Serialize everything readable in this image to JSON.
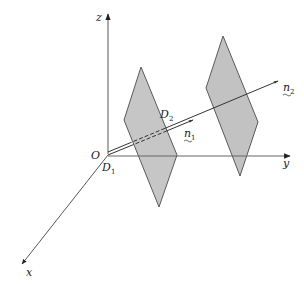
{
  "diagram": {
    "type": "3d-axes-planes",
    "colors": {
      "axis": "#555555",
      "plane_fill": "#c4c4c4",
      "plane_stroke": "#5a5a5a",
      "line": "#333333",
      "background": "#ffffff"
    },
    "axes": {
      "origin_label": "O",
      "x_label": "x",
      "y_label": "y",
      "z_label": "z"
    },
    "points": {
      "d1": {
        "letter": "D",
        "sub": "1"
      },
      "d2": {
        "letter": "D",
        "sub": "2"
      }
    },
    "vectors": {
      "n1": {
        "letter": "n",
        "sub": "1"
      },
      "n2": {
        "letter": "n",
        "sub": "2"
      }
    },
    "planes": [
      {
        "name": "plane-1",
        "points": "141,67 124,120 159,207 177,155"
      },
      {
        "name": "plane-2",
        "points": "223,36 206,88 240,176 258,122"
      }
    ]
  }
}
